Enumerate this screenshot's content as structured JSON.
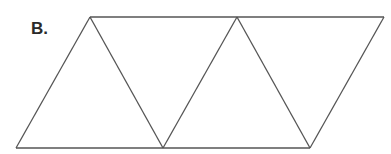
{
  "figure": {
    "label": "B.",
    "stroke_color": "#555555",
    "shape": "net of three equilateral triangles plus inverted triangles forming a strip",
    "vertices": {
      "top": [
        [
          90,
          17
        ],
        [
          237,
          17
        ],
        [
          384,
          17
        ]
      ],
      "bottom": [
        [
          16,
          148
        ],
        [
          163,
          148
        ],
        [
          310,
          148
        ]
      ]
    }
  }
}
